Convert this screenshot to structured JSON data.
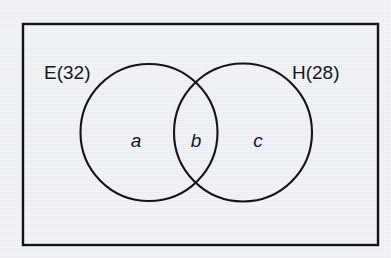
{
  "figure": {
    "type": "venn-diagram",
    "universe": {
      "shape": "rectangle",
      "label": ""
    },
    "sets": [
      {
        "id": "E",
        "label": "E(32)",
        "name": "E",
        "count": 32,
        "position": "left"
      },
      {
        "id": "H",
        "label": "H(28)",
        "name": "H",
        "count": 28,
        "position": "right"
      }
    ],
    "regions": [
      {
        "id": "a",
        "label": "a",
        "meaning": "E only",
        "position": "left-circle-only"
      },
      {
        "id": "b",
        "label": "b",
        "meaning": "E and H",
        "position": "intersection"
      },
      {
        "id": "c",
        "label": "c",
        "meaning": "H only",
        "position": "right-circle-only"
      }
    ],
    "colors": {
      "background": "#eceef4",
      "stroke": "#121419",
      "text": "#14161c"
    }
  }
}
